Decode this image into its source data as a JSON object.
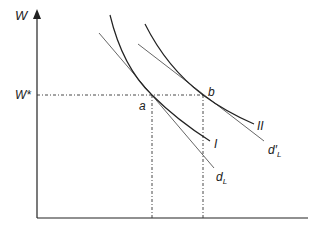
{
  "axes": {
    "y_label": "W",
    "x_label": ""
  },
  "levels": {
    "w_star": "W*"
  },
  "points": {
    "a": "a",
    "b": "b"
  },
  "curves": {
    "indiff_1": "I",
    "indiff_2": "II",
    "demand_1": "d",
    "demand_1_sub": "L",
    "demand_2": "d′",
    "demand_2_sub": "L"
  },
  "colors": {
    "line": "#222222",
    "tangent": "#444444",
    "dashed": "#333333"
  }
}
